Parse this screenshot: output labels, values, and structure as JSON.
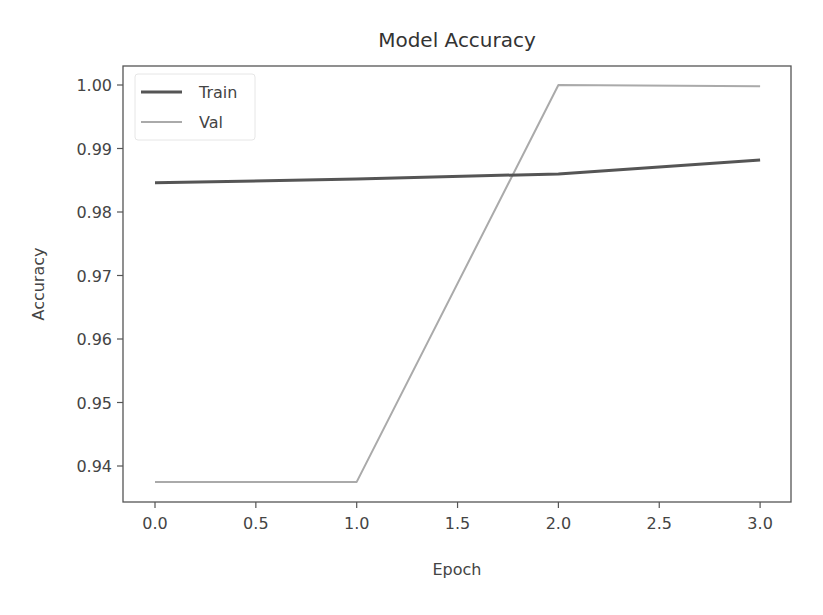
{
  "chart_data": {
    "type": "line",
    "title": "Model Accuracy",
    "xlabel": "Epoch",
    "ylabel": "Accuracy",
    "x": [
      0,
      1,
      2,
      3
    ],
    "xticks": [
      0.0,
      0.5,
      1.0,
      1.5,
      2.0,
      2.5,
      3.0
    ],
    "xtick_labels": [
      "0.0",
      "0.5",
      "1.0",
      "1.5",
      "2.0",
      "2.5",
      "3.0"
    ],
    "yticks": [
      0.94,
      0.95,
      0.96,
      0.97,
      0.98,
      0.99,
      1.0
    ],
    "ytick_labels": [
      "0.94",
      "0.95",
      "0.96",
      "0.97",
      "0.98",
      "0.99",
      "1.00"
    ],
    "xlim": [
      -0.15,
      3.15
    ],
    "ylim": [
      0.9344,
      1.003
    ],
    "grid": false,
    "legend_position": "upper left",
    "series": [
      {
        "name": "Train",
        "color": "#555555",
        "width": 3,
        "values": [
          0.9846,
          0.9852,
          0.986,
          0.9882
        ]
      },
      {
        "name": "Val",
        "color": "#aaaaaa",
        "width": 2,
        "values": [
          0.9375,
          0.9375,
          1.0,
          0.9998
        ]
      }
    ]
  }
}
